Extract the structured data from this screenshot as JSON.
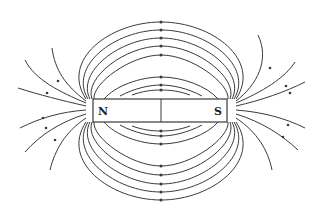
{
  "diagram": {
    "magnet": {
      "north_label": "N",
      "south_label": "S"
    },
    "colors": {
      "line": "#3a3a3a",
      "background": "#ffffff"
    }
  }
}
